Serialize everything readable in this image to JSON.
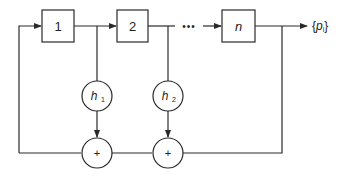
{
  "diagram": {
    "title": "",
    "blocks": [
      {
        "id": "stage-1",
        "label": "1",
        "italic": false
      },
      {
        "id": "stage-2",
        "label": "2",
        "italic": false
      },
      {
        "id": "stage-n",
        "label": "n",
        "italic": true
      }
    ],
    "ellipsis": "•••",
    "multipliers": [
      {
        "id": "h1",
        "label": "h",
        "subscript": "1"
      },
      {
        "id": "h2",
        "label": "h",
        "subscript": "2"
      }
    ],
    "adders": [
      {
        "id": "sum-1",
        "label": "+"
      },
      {
        "id": "sum-2",
        "label": "+"
      }
    ],
    "output": {
      "label_open": "{",
      "symbol": "p",
      "subscript": "i",
      "label_close": "}"
    }
  }
}
